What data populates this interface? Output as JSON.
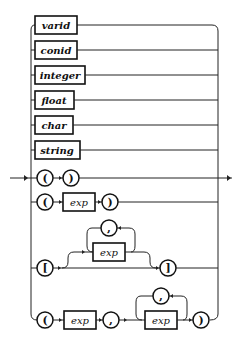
{
  "diagram": {
    "type": "railroad-syntax-diagram",
    "terminals": {
      "varid": "varid",
      "conid": "conid",
      "integer": "integer",
      "float": "float",
      "char": "char",
      "string": "string"
    },
    "unit_row": {
      "open": "(",
      "close": ")"
    },
    "paren_row": {
      "open": "(",
      "exp": "exp",
      "close": ")"
    },
    "list_row": {
      "open": "[",
      "exp": "exp",
      "sep": ",",
      "close": "]"
    },
    "tuple_row": {
      "open": "(",
      "exp1": "exp",
      "sep1": ",",
      "exp2": "exp",
      "sep2": ",",
      "close": ")"
    },
    "colors": {
      "line": "#222222",
      "background": "#ffffff"
    }
  }
}
